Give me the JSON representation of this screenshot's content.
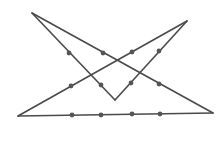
{
  "diagram": {
    "stroke_color": "#4a4a4a",
    "dot_color": "#555555",
    "vertices": {
      "top_left": [
        32,
        13
      ],
      "top_right": [
        187,
        21
      ],
      "bottom_left": [
        18,
        116
      ],
      "bottom_right": [
        213,
        113
      ],
      "v_bottom": [
        115,
        100
      ]
    },
    "segments": [
      {
        "from": [
          32,
          13
        ],
        "to": [
          213,
          113
        ]
      },
      {
        "from": [
          32,
          13
        ],
        "to": [
          115,
          100
        ]
      },
      {
        "from": [
          115,
          100
        ],
        "to": [
          187,
          21
        ]
      },
      {
        "from": [
          187,
          21
        ],
        "to": [
          18,
          116
        ]
      },
      {
        "from": [
          18,
          116
        ],
        "to": [
          213,
          113
        ]
      }
    ],
    "points": [
      [
        69,
        53
      ],
      [
        103,
        53
      ],
      [
        132,
        52
      ],
      [
        159,
        51
      ],
      [
        71,
        86
      ],
      [
        101,
        85
      ],
      [
        131,
        83
      ],
      [
        159,
        84
      ],
      [
        72,
        115
      ],
      [
        101,
        115
      ],
      [
        132,
        114
      ],
      [
        160,
        114
      ]
    ]
  }
}
